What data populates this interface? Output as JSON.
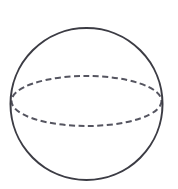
{
  "figure": {
    "name": "sphere-with-equator",
    "kind": "line-drawing",
    "canvas": {
      "width": 178,
      "height": 189,
      "background_color": "#ffffff"
    },
    "style": {
      "outline_color": "#3c3c44",
      "outline_width": 2,
      "hidden_line_color": "#555560",
      "hidden_line_width": 2,
      "dash_length": 6,
      "gap_length": 3.5
    },
    "shapes": {
      "sphere_outline": {
        "label": "sphere-outline",
        "type": "circle",
        "center_x": 86.5,
        "center_y": 104,
        "radius": 76,
        "line_style": "solid"
      },
      "equator": {
        "label": "equator-ellipse",
        "type": "ellipse",
        "center_x": 86.5,
        "center_y": 101,
        "radius_x": 75,
        "radius_y": 25,
        "line_style": "dashed"
      }
    }
  },
  "chart_data": {
    "type": "diagram",
    "title": "",
    "subtitle": "",
    "xlabel": "",
    "ylabel": "",
    "legend": [],
    "annotations": [],
    "elements": [
      {
        "name": "sphere-outline",
        "shape": "circle",
        "cx": 86.5,
        "cy": 104,
        "r": 76,
        "stroke": "#3c3c44",
        "stroke_width": 2,
        "dashed": false
      },
      {
        "name": "equator-ellipse",
        "shape": "ellipse",
        "cx": 86.5,
        "cy": 101,
        "rx": 75,
        "ry": 25,
        "stroke": "#555560",
        "stroke_width": 2,
        "dashed": true,
        "dash_array": "6 3.5"
      }
    ]
  }
}
